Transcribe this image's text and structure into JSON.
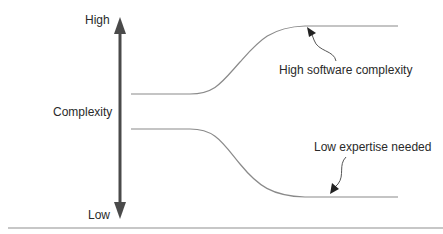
{
  "diagram": {
    "axis": {
      "top_label": "High",
      "bottom_label": "Low",
      "middle_label": "Complexity"
    },
    "curves": [
      {
        "name": "software-complexity",
        "trend": "rises from middle to high"
      },
      {
        "name": "expertise-needed",
        "trend": "falls from middle to low"
      }
    ],
    "annotations": {
      "upper": "High software complexity",
      "lower": "Low expertise needed"
    },
    "colors": {
      "axis": "#4a4a4a",
      "curve": "#8a8a8a",
      "text": "#2a2a2a",
      "baseline": "#b5b5b5"
    }
  }
}
